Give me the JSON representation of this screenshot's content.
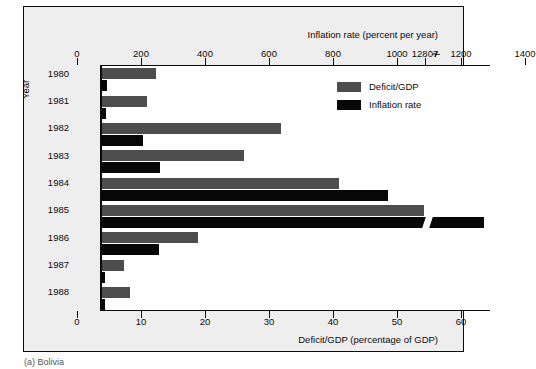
{
  "figure": {
    "caption": "(a) Bolivia"
  },
  "legend": {
    "position": "inside-top-right",
    "items": [
      {
        "label": "Deficit/GDP",
        "color": "#4d4d4d",
        "swatch_name": "legend-swatch-deficit"
      },
      {
        "label": "Inflation rate",
        "color": "#070707",
        "swatch_name": "legend-swatch-inflation"
      }
    ]
  },
  "axes": {
    "top": {
      "title": "Inflation rate (percent per year)",
      "ticks": [
        "0",
        "200",
        "400",
        "600",
        "800",
        "1000",
        "1200",
        "1400",
        "12807"
      ],
      "break_symbol": "≁"
    },
    "bottom": {
      "title": "Deficit/GDP (percentage of GDP)",
      "ticks": [
        "0",
        "10",
        "20",
        "30",
        "40",
        "50",
        "60"
      ]
    },
    "left": {
      "title": "Year",
      "ticks": [
        "1980",
        "1981",
        "1982",
        "1983",
        "1984",
        "1985",
        "1986",
        "1987",
        "1988"
      ]
    }
  },
  "chart_data": {
    "type": "bar",
    "orientation": "horizontal",
    "title": "",
    "subtitle": "",
    "caption": "(a) Bolivia",
    "categories": [
      "1980",
      "1981",
      "1982",
      "1983",
      "1984",
      "1985",
      "1986",
      "1987",
      "1988"
    ],
    "xlabel_bottom": "Deficit/GDP (percentage of GDP)",
    "xlabel_top": "Inflation rate (percent per year)",
    "ylabel": "Year",
    "xlim_bottom": [
      0,
      61
    ],
    "xlim_top": [
      0,
      1525
    ],
    "grid": false,
    "legend_position": "inside-top-right",
    "axis_break": {
      "present": true,
      "on_series": "Inflation rate",
      "category": "1985",
      "true_value": 12807,
      "top_axis_break_after": 1400
    },
    "series": [
      {
        "name": "Deficit/GDP",
        "color": "#4d4d4d",
        "unit": "percentage of GDP",
        "axis": "bottom",
        "values": [
          8.4,
          7.0,
          28.0,
          22.2,
          37.0,
          50.3,
          15.0,
          3.5,
          4.4
        ]
      },
      {
        "name": "Inflation rate",
        "color": "#070707",
        "unit": "percent per year",
        "axis": "top",
        "values": [
          47,
          32,
          296,
          328,
          2177,
          12807,
          276,
          15,
          16
        ],
        "plotted_lengths_percent_of_bottom_axis": [
          0.8,
          0.6,
          6.4,
          9.0,
          44.7,
          59.7,
          8.9,
          0.4,
          0.5
        ]
      }
    ]
  }
}
